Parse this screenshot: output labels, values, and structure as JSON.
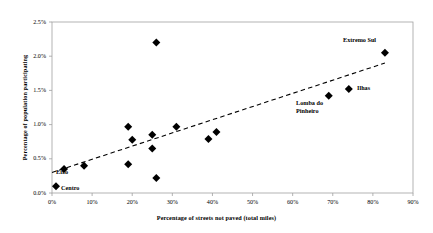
{
  "chart_data": {
    "type": "scatter",
    "title": "",
    "xlabel": "Percentage of streets not paved (total miles)",
    "ylabel": "Percentage of population participating",
    "xlim": [
      0,
      90
    ],
    "ylim": [
      0,
      2.5
    ],
    "x_tick_labels": [
      "0%",
      "10%",
      "20%",
      "30%",
      "40%",
      "50%",
      "60%",
      "70%",
      "80%",
      "90%"
    ],
    "x_tick_values": [
      0,
      10,
      20,
      30,
      40,
      50,
      60,
      70,
      80,
      90
    ],
    "y_tick_labels": [
      "0.0%",
      "0.5%",
      "1.0%",
      "1.5%",
      "2.0%",
      "2.5%"
    ],
    "y_tick_values": [
      0,
      0.5,
      1.0,
      1.5,
      2.0,
      2.5
    ],
    "grid": false,
    "legend": "none",
    "marker": "diamond",
    "marker_color": "#000000",
    "trendline": {
      "style": "dashed",
      "color": "#000000",
      "x_start": 0,
      "y_start": 0.3,
      "x_end": 83,
      "y_end": 1.9
    },
    "points": [
      {
        "x": 1,
        "y": 0.1,
        "label": "Centro"
      },
      {
        "x": 3,
        "y": 0.35,
        "label": "Eixo"
      },
      {
        "x": 8,
        "y": 0.4,
        "label": ""
      },
      {
        "x": 19,
        "y": 0.97,
        "label": ""
      },
      {
        "x": 19,
        "y": 0.42,
        "label": ""
      },
      {
        "x": 20,
        "y": 0.78,
        "label": ""
      },
      {
        "x": 25,
        "y": 0.85,
        "label": ""
      },
      {
        "x": 25,
        "y": 0.65,
        "label": ""
      },
      {
        "x": 26,
        "y": 2.2,
        "label": ""
      },
      {
        "x": 26,
        "y": 0.22,
        "label": ""
      },
      {
        "x": 31,
        "y": 0.97,
        "label": ""
      },
      {
        "x": 39,
        "y": 0.79,
        "label": ""
      },
      {
        "x": 41,
        "y": 0.89,
        "label": ""
      },
      {
        "x": 69,
        "y": 1.42,
        "label": "Lomba do\nPinheiro"
      },
      {
        "x": 74,
        "y": 1.52,
        "label": "Ilhas"
      },
      {
        "x": 83,
        "y": 2.05,
        "label": "Extremo Sul"
      }
    ],
    "annotations": [
      {
        "text": "Centro",
        "x": 1,
        "y": 0.1
      },
      {
        "text": "Eixo",
        "x": 3,
        "y": 0.35
      },
      {
        "text": "Lomba do Pinheiro",
        "x": 69,
        "y": 1.42
      },
      {
        "text": "Ilhas",
        "x": 74,
        "y": 1.52
      },
      {
        "text": "Extremo Sul",
        "x": 83,
        "y": 2.05
      }
    ]
  },
  "labels": {
    "centro": "Centro",
    "eixo": "Eixo",
    "lomba_line1": "Lomba do",
    "lomba_line2": "Pinheiro",
    "ilhas": "Ilhas",
    "extremo_sul": "Extremo Sul"
  },
  "axis": {
    "x_title": "Percentage of streets not paved (total miles)",
    "y_title": "Percentage of population participating"
  },
  "y_ticks": [
    "2.5%",
    "2.0%",
    "1.5%",
    "1.0%",
    "0.5%",
    "0.0%"
  ],
  "x_ticks": [
    "0%",
    "10%",
    "20%",
    "30%",
    "40%",
    "50%",
    "60%",
    "70%",
    "80%",
    "90%"
  ],
  "colors": {
    "marker": "#000000",
    "frame": "#9a9a9a",
    "trendline": "#333333",
    "background": "#ffffff"
  }
}
